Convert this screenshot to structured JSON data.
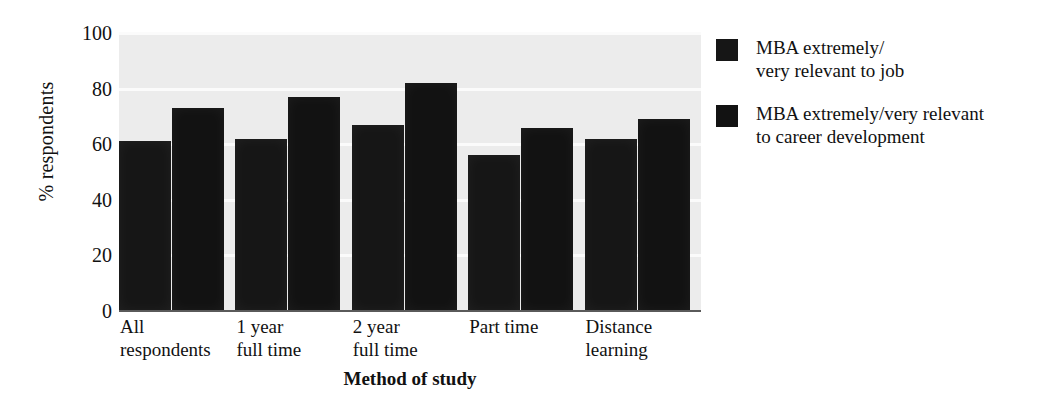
{
  "chart_data": {
    "type": "bar",
    "title": "",
    "xlabel": "Method of study",
    "ylabel": "% respondents",
    "ylim": [
      0,
      100
    ],
    "yticks": [
      100,
      80,
      60,
      40,
      20,
      0
    ],
    "grid": true,
    "legend_position": "right",
    "categories": [
      "All\nrespondents",
      "1 year\nfull time",
      "2 year\nfull time",
      "Part time",
      "Distance\nlearning"
    ],
    "series": [
      {
        "name": "MBA extremely/\nvery relevant to job",
        "color": "#161616",
        "values": [
          61,
          62,
          67,
          56,
          62
        ]
      },
      {
        "name": "MBA extremely/very relevant\nto career development",
        "color": "#121212",
        "values": [
          73,
          77,
          82,
          66,
          69
        ]
      }
    ]
  },
  "axis": {
    "y_title": "% respondents",
    "x_title": "Method of study",
    "y_tick_labels": [
      "100",
      "80",
      "60",
      "40",
      "20",
      "0"
    ]
  },
  "legend": {
    "items": [
      {
        "label": "MBA extremely/\nvery relevant to job"
      },
      {
        "label": "MBA extremely/very relevant\nto career development"
      }
    ]
  },
  "style": {
    "plot_background": "#ececec",
    "bar_color": "#171717",
    "gridline_color": "#fbfbfb",
    "axis_color": "#5a5a5a"
  }
}
